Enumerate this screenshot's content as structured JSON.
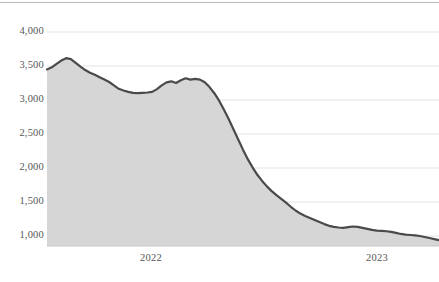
{
  "chart_data": {
    "type": "area",
    "title": "",
    "subtitle": "",
    "xlabel": "",
    "ylabel": "",
    "grid": true,
    "legend": null,
    "ylim": [
      700,
      4000
    ],
    "yticks": [
      1000,
      1500,
      2000,
      2500,
      3000,
      3500,
      4000
    ],
    "ytick_labels": [
      "1,000",
      "1,500",
      "2,000",
      "2,500",
      "3,000",
      "3,500",
      "4,000"
    ],
    "xticks": [
      2022,
      2023
    ],
    "xtick_labels": [
      "2022",
      "2023"
    ],
    "xlim": [
      0,
      82
    ],
    "series": [
      {
        "name": "value",
        "x": [
          0,
          1,
          2,
          3,
          4,
          5,
          6,
          7,
          8,
          9,
          10,
          11,
          12,
          13,
          14,
          15,
          16,
          17,
          18,
          19,
          20,
          21,
          22,
          23,
          24,
          25,
          26,
          27,
          28,
          29,
          30,
          31,
          32,
          33,
          34,
          35,
          36,
          37,
          38,
          39,
          40,
          41,
          42,
          43,
          44,
          45,
          46,
          47,
          48,
          49,
          50,
          51,
          52,
          53,
          54,
          55,
          56,
          57,
          58,
          59,
          60,
          61,
          62,
          63,
          64,
          65,
          66,
          67,
          68,
          69,
          70,
          71,
          72,
          73,
          74,
          75,
          76,
          77,
          78,
          79,
          80,
          81,
          82
        ],
        "values": [
          3450,
          3480,
          3530,
          3580,
          3615,
          3600,
          3545,
          3490,
          3440,
          3400,
          3370,
          3335,
          3300,
          3265,
          3215,
          3165,
          3140,
          3120,
          3105,
          3100,
          3105,
          3110,
          3120,
          3160,
          3215,
          3260,
          3275,
          3250,
          3290,
          3320,
          3300,
          3310,
          3300,
          3260,
          3190,
          3100,
          2990,
          2860,
          2720,
          2570,
          2420,
          2270,
          2130,
          2010,
          1900,
          1810,
          1730,
          1660,
          1600,
          1545,
          1490,
          1430,
          1375,
          1330,
          1295,
          1265,
          1235,
          1205,
          1175,
          1150,
          1135,
          1125,
          1120,
          1130,
          1140,
          1135,
          1120,
          1105,
          1090,
          1080,
          1075,
          1070,
          1060,
          1045,
          1030,
          1020,
          1015,
          1010,
          1000,
          985,
          970,
          955,
          940
        ]
      }
    ]
  },
  "axis": {
    "ytick_labels": [
      "4,000",
      "3,500",
      "3,000",
      "2,500",
      "2,000",
      "1,500",
      "1,000"
    ],
    "xtick_labels": [
      "2022",
      "2023"
    ]
  },
  "colors": {
    "line": "#4a4a4a",
    "fill": "#d6d6d6",
    "grid": "#e3e3e3",
    "axis": "#c8c8c8",
    "tick_text": "#565656",
    "top_rule": "#b9b9b9",
    "background": "#ffffff"
  }
}
